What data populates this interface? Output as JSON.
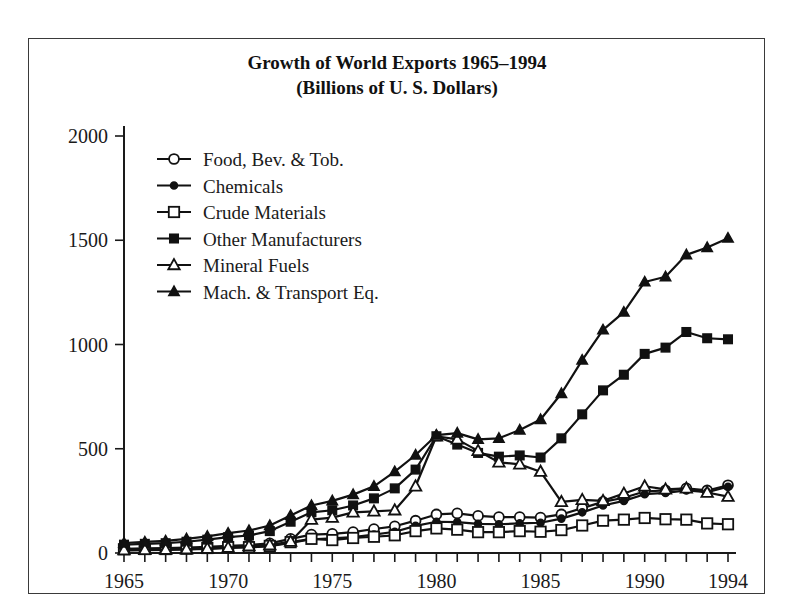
{
  "chart_data": {
    "type": "line",
    "title": "Growth of World Exports 1965–1994",
    "subtitle": "(Billions of U. S. Dollars)",
    "xlabel": "",
    "ylabel": "",
    "xlim": [
      1965,
      1994
    ],
    "ylim": [
      0,
      2000
    ],
    "yticks": [
      0,
      500,
      1000,
      1500,
      2000
    ],
    "ytick_labels": [
      "0",
      "500",
      "1000",
      "1500",
      "2000"
    ],
    "xticks": [
      1965,
      1966,
      1967,
      1968,
      1969,
      1970,
      1971,
      1972,
      1973,
      1974,
      1975,
      1976,
      1977,
      1978,
      1979,
      1980,
      1981,
      1982,
      1983,
      1984,
      1985,
      1986,
      1987,
      1988,
      1989,
      1990,
      1991,
      1992,
      1993,
      1994
    ],
    "xtick_labels_shown": [
      "1965",
      "1970",
      "1975",
      "1980",
      "1985",
      "1990",
      "1994"
    ],
    "xtick_labels_years": [
      1965,
      1970,
      1975,
      1980,
      1985,
      1990,
      1994
    ],
    "grid": false,
    "legend_position": "upper-left-inside",
    "x": [
      1965,
      1966,
      1967,
      1968,
      1969,
      1970,
      1971,
      1972,
      1973,
      1974,
      1975,
      1976,
      1977,
      1978,
      1979,
      1980,
      1981,
      1982,
      1983,
      1984,
      1985,
      1986,
      1987,
      1988,
      1989,
      1990,
      1991,
      1992,
      1993,
      1994
    ],
    "series": [
      {
        "name": "Food, Bev. & Tob.",
        "marker": "open-circle",
        "values": [
          20,
          22,
          24,
          26,
          30,
          34,
          38,
          46,
          68,
          88,
          92,
          100,
          115,
          128,
          155,
          185,
          190,
          178,
          172,
          172,
          170,
          185,
          215,
          245,
          265,
          295,
          300,
          310,
          300,
          325
        ]
      },
      {
        "name": "Chemicals",
        "marker": "filled-circle",
        "values": [
          12,
          14,
          15,
          17,
          20,
          24,
          27,
          33,
          48,
          66,
          70,
          76,
          88,
          102,
          130,
          150,
          148,
          140,
          138,
          142,
          145,
          165,
          195,
          228,
          250,
          282,
          288,
          300,
          292,
          318
        ]
      },
      {
        "name": "Crude Materials",
        "marker": "open-square",
        "values": [
          18,
          19,
          19,
          21,
          24,
          28,
          28,
          34,
          52,
          68,
          62,
          72,
          78,
          85,
          105,
          118,
          112,
          100,
          100,
          105,
          102,
          110,
          132,
          155,
          160,
          168,
          162,
          160,
          142,
          138
        ]
      },
      {
        "name": "Other Manufacturers",
        "marker": "filled-square",
        "values": [
          40,
          44,
          47,
          54,
          64,
          76,
          84,
          105,
          150,
          195,
          205,
          228,
          262,
          310,
          400,
          560,
          520,
          480,
          462,
          468,
          458,
          550,
          665,
          780,
          855,
          955,
          985,
          1060,
          1030,
          1025
        ]
      },
      {
        "name": "Mineral Fuels",
        "marker": "open-triangle",
        "values": [
          14,
          15,
          16,
          18,
          21,
          26,
          33,
          38,
          55,
          160,
          170,
          195,
          200,
          205,
          320,
          560,
          545,
          490,
          435,
          425,
          390,
          245,
          255,
          250,
          285,
          320,
          305,
          310,
          290,
          270
        ]
      },
      {
        "name": "Mach. & Transport Eq.",
        "marker": "filled-triangle",
        "values": [
          48,
          53,
          58,
          68,
          80,
          95,
          108,
          132,
          180,
          228,
          250,
          280,
          320,
          390,
          470,
          565,
          575,
          545,
          550,
          590,
          640,
          765,
          925,
          1070,
          1155,
          1300,
          1325,
          1430,
          1465,
          1510
        ]
      }
    ]
  },
  "figure": {
    "axis_color": "#1a1a1a",
    "line_color": "#111111",
    "background": "#ffffff"
  }
}
